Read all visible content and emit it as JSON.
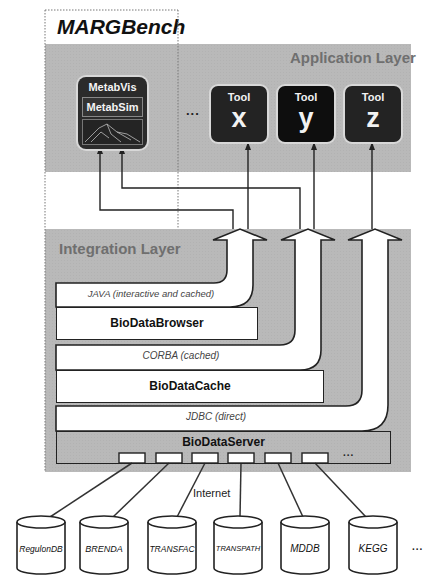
{
  "title": "MARGBench",
  "application_layer": {
    "label": "Application Layer",
    "metab_tool": {
      "top_label": "MetabVis",
      "inner_label": "MetabSim"
    },
    "ellipsis": "...",
    "tools": [
      {
        "label": "Tool",
        "letter": "x"
      },
      {
        "label": "Tool",
        "letter": "y"
      },
      {
        "label": "Tool",
        "letter": "z"
      }
    ]
  },
  "integration_layer": {
    "label": "Integration Layer",
    "protocols": [
      "JAVA (interactive and cached)",
      "CORBA (cached)",
      "JDBC (direct)"
    ],
    "components": [
      "BioDataBrowser",
      "BioDataCache",
      "BioDataServer"
    ],
    "server_ports_ellipsis": "..."
  },
  "network_label": "Internet",
  "databases": [
    "RegulonDB",
    "BRENDA",
    "TRANSFAC",
    "TRANSPATH",
    "MDDB",
    "KEGG"
  ],
  "databases_ellipsis": "..."
}
